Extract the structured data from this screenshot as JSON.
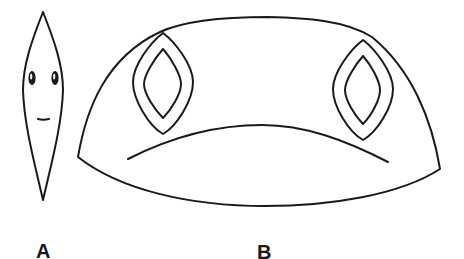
{
  "figure": {
    "panels": [
      {
        "id": "A",
        "label": "A",
        "description": "Narrow lens-shaped (spindle) outline with two small eyes and a short mouth line"
      },
      {
        "id": "B",
        "label": "B",
        "description": "Wide dome-shaped outline with two concentric diamond-shaped eyes and a downward-curving arc mouth"
      }
    ],
    "stroke_color": "#1a1a1a",
    "background_color": "#ffffff"
  }
}
